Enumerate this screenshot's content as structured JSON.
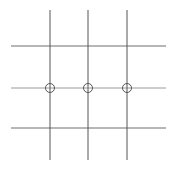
{
  "canvas": {
    "width": 176,
    "height": 169,
    "background": "#ffffff",
    "title": "grid-with-nodes-diagram"
  },
  "style": {
    "vertical_line_color": "#555555",
    "horizontal_line_color": "#6e6e6e",
    "middle_horizontal_line_color": "#9a9a9a",
    "circle_stroke_color": "#555555",
    "circle_fill": "none",
    "line_width": 1,
    "circle_stroke_width": 1
  },
  "chart_data": {
    "type": "scatter",
    "title": "",
    "xlabel": "",
    "ylabel": "",
    "grid": true,
    "legend": "none",
    "xlim": [
      0,
      176
    ],
    "ylim": [
      0,
      169
    ],
    "vertical_lines": [
      {
        "name": "vertical-line-1",
        "x": 50,
        "y1": 10,
        "y2": 160,
        "color": "#555555"
      },
      {
        "name": "vertical-line-2",
        "x": 88,
        "y1": 10,
        "y2": 160,
        "color": "#555555"
      },
      {
        "name": "vertical-line-3",
        "x": 127,
        "y1": 10,
        "y2": 160,
        "color": "#555555"
      }
    ],
    "horizontal_lines": [
      {
        "name": "horizontal-line-top",
        "y": 46,
        "x1": 11,
        "x2": 166,
        "color": "#6e6e6e"
      },
      {
        "name": "horizontal-line-middle",
        "y": 88,
        "x1": 11,
        "x2": 166,
        "color": "#9a9a9a"
      },
      {
        "name": "horizontal-line-bottom",
        "y": 128,
        "x1": 11,
        "x2": 166,
        "color": "#6e6e6e"
      }
    ],
    "nodes": [
      {
        "name": "node-1",
        "cx": 50,
        "cy": 88,
        "r": 4.5
      },
      {
        "name": "node-2",
        "cx": 88,
        "cy": 88,
        "r": 4.5
      },
      {
        "name": "node-3",
        "cx": 127,
        "cy": 88,
        "r": 4.5
      }
    ]
  }
}
